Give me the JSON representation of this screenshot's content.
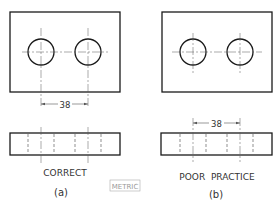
{
  "figure": {
    "panel_a": {
      "dimension": "38",
      "caption": "CORRECT",
      "label": "(a)"
    },
    "panel_b": {
      "dimension": "38",
      "caption": "POOR  PRACTICE",
      "label": "(b)"
    },
    "units_badge": "METRIC",
    "colors": {
      "line": "#1a1a1a",
      "thin": "#555555",
      "badge": "#999999"
    }
  }
}
